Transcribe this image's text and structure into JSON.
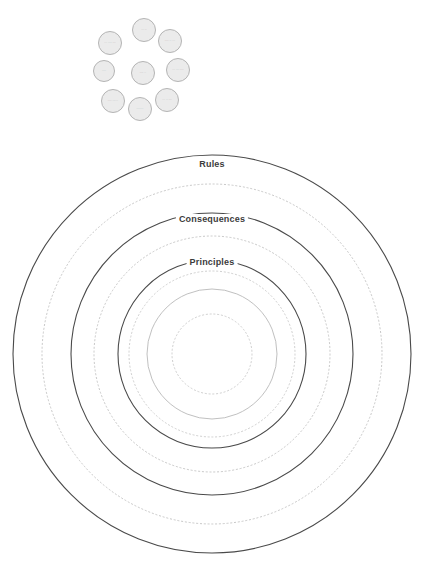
{
  "diagram": {
    "center": {
      "x": 212,
      "y": 354
    },
    "rings": [
      {
        "id": "rules",
        "radius": 199,
        "style": "solid",
        "color": "#4a4a4a",
        "width": 1.1,
        "label": "Rules",
        "label_y": 164
      },
      {
        "id": "ring-2",
        "radius": 170,
        "style": "dotted",
        "color": "#c8c8c8",
        "width": 1.0,
        "label": "",
        "label_y": 0
      },
      {
        "id": "consequences",
        "radius": 141,
        "style": "solid",
        "color": "#4a4a4a",
        "width": 1.1,
        "label": "Consequences",
        "label_y": 219
      },
      {
        "id": "ring-4",
        "radius": 118,
        "style": "dotted",
        "color": "#c8c8c8",
        "width": 1.0,
        "label": "",
        "label_y": 0
      },
      {
        "id": "principles",
        "radius": 94,
        "style": "solid",
        "color": "#4a4a4a",
        "width": 1.1,
        "label": "Principles",
        "label_y": 262
      },
      {
        "id": "ring-6",
        "radius": 83,
        "style": "dotted",
        "color": "#cfcfcf",
        "width": 1.0,
        "label": "",
        "label_y": 0
      },
      {
        "id": "ring-7",
        "radius": 65,
        "style": "solid",
        "color": "#b9b9b9",
        "width": 0.9,
        "label": "",
        "label_y": 0
      },
      {
        "id": "ring-8",
        "radius": 40,
        "style": "dotted",
        "color": "#cfcfcf",
        "width": 1.0,
        "label": "",
        "label_y": 0
      }
    ]
  },
  "bubble_cluster": {
    "fill_color": "#ebebeb",
    "stroke_color": "#b4b4b4",
    "note": "Nine pale grey circles; their micro-text is rendered below legible resolution in the source image and reads as indistinct grey marks.",
    "bubbles": [
      {
        "id": "bubble-top",
        "x": 144,
        "y": 30,
        "d": 24,
        "text": "▫▫▫ ▫▫"
      },
      {
        "id": "bubble-top-right",
        "x": 170,
        "y": 41,
        "d": 24,
        "text": "▫▫▫▫ ▫▫ ▫▫▫"
      },
      {
        "id": "bubble-top-left",
        "x": 110,
        "y": 43,
        "d": 24,
        "text": "▫▫▫ ▫▫▫▫ ▫▫▫"
      },
      {
        "id": "bubble-right",
        "x": 178,
        "y": 70,
        "d": 24,
        "text": "▫▫▫ ▫▫▫ ▫▫▫▫"
      },
      {
        "id": "bubble-center",
        "x": 143,
        "y": 73,
        "d": 24,
        "text": "▫▫▫▫ ▫▫"
      },
      {
        "id": "bubble-left",
        "x": 104,
        "y": 71,
        "d": 22,
        "text": "▫▫▫▫"
      },
      {
        "id": "bubble-bottom-right",
        "x": 167,
        "y": 100,
        "d": 24,
        "text": "▫▫▫ ▫▫ ▫▫▫"
      },
      {
        "id": "bubble-bottom",
        "x": 140,
        "y": 109,
        "d": 24,
        "text": "▫▫▫▫▫▫▫"
      },
      {
        "id": "bubble-bottom-left",
        "x": 113,
        "y": 101,
        "d": 24,
        "text": "▫▫▫▫ ▫▫▫▫▫▫"
      }
    ]
  }
}
